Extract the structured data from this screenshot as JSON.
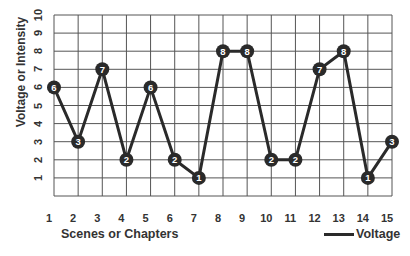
{
  "chart_data": {
    "type": "line",
    "title": "",
    "xlabel": "Scenes or Chapters",
    "ylabel": "Voltage or Intensity",
    "categories": [
      "1",
      "2",
      "3",
      "4",
      "5",
      "6",
      "7",
      "8",
      "9",
      "10",
      "11",
      "12",
      "13",
      "14",
      "15"
    ],
    "x": [
      1,
      2,
      3,
      4,
      5,
      6,
      7,
      8,
      9,
      10,
      11,
      12,
      13,
      14,
      15
    ],
    "series": [
      {
        "name": "Voltage",
        "values": [
          6,
          3,
          7,
          2,
          6,
          2,
          1,
          8,
          8,
          2,
          2,
          7,
          8,
          1,
          3
        ]
      }
    ],
    "xlim": [
      1,
      15
    ],
    "ylim": [
      0,
      10
    ],
    "yticks": [
      "1",
      "2",
      "3",
      "4",
      "5",
      "6",
      "7",
      "8",
      "9",
      "10"
    ],
    "grid": true,
    "legend_position": "bottom-right",
    "data_labels": true,
    "colors": {
      "line": "#2a2a2a",
      "marker": "#2a2a2a",
      "marker_text": "#ffffff",
      "grid": "#555555"
    }
  }
}
